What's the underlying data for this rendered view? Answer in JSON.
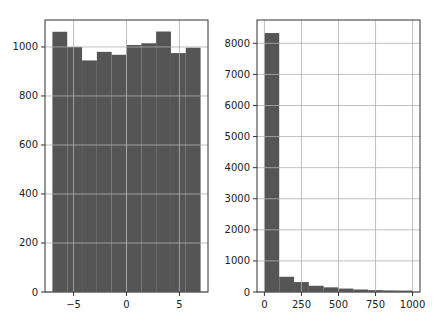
{
  "chart_data": [
    {
      "type": "bar",
      "subtype": "histogram",
      "title": "",
      "xlabel": "",
      "ylabel": "",
      "bin_edges": [
        -7.0,
        -5.6,
        -4.2,
        -2.8,
        -1.4,
        0.0,
        1.4,
        2.8,
        4.2,
        5.6,
        7.0
      ],
      "values": [
        1062,
        1000,
        945,
        980,
        968,
        1008,
        1015,
        1063,
        975,
        997
      ],
      "xlim": [
        -7.7,
        7.7
      ],
      "ylim": [
        0,
        1110
      ],
      "xticks": [
        -5,
        0,
        5
      ],
      "xtick_labels": [
        "−5",
        "0",
        "5"
      ],
      "yticks": [
        0,
        200,
        400,
        600,
        800,
        1000
      ],
      "ytick_labels": [
        "0",
        "200",
        "400",
        "600",
        "800",
        "1000"
      ],
      "grid": true,
      "bar_color": "#555555"
    },
    {
      "type": "bar",
      "subtype": "histogram",
      "title": "",
      "xlabel": "",
      "ylabel": "",
      "bin_edges": [
        0,
        100,
        200,
        300,
        400,
        500,
        600,
        700,
        800,
        900,
        1000
      ],
      "values": [
        8330,
        490,
        320,
        200,
        150,
        110,
        80,
        60,
        50,
        45
      ],
      "xlim": [
        -50,
        1050
      ],
      "ylim": [
        0,
        8750
      ],
      "xticks": [
        0,
        250,
        500,
        750,
        1000
      ],
      "xtick_labels": [
        "0",
        "250",
        "500",
        "750",
        "1000"
      ],
      "yticks": [
        0,
        1000,
        2000,
        3000,
        4000,
        5000,
        6000,
        7000,
        8000
      ],
      "ytick_labels": [
        "0",
        "1000",
        "2000",
        "3000",
        "4000",
        "5000",
        "6000",
        "7000",
        "8000"
      ],
      "grid": true,
      "bar_color": "#555555"
    }
  ],
  "colors": {
    "bar": "#555555",
    "grid": "#b0b0b0",
    "axes": "#333333",
    "background": "#ffffff"
  }
}
